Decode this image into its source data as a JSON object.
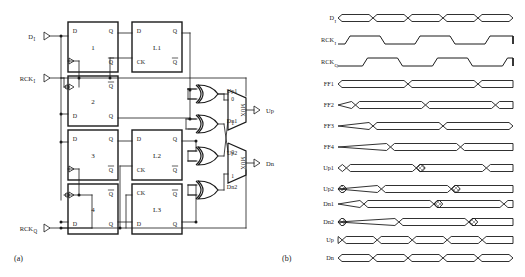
{
  "figure": {
    "panels": [
      {
        "id": "a",
        "caption": "(a)",
        "type": "schematic"
      },
      {
        "id": "b",
        "caption": "(b)",
        "type": "timing-diagram"
      }
    ]
  },
  "schematic": {
    "inputs": [
      {
        "name": "D_I",
        "label": "D",
        "sub": "I",
        "y": 36
      },
      {
        "name": "RCK_I",
        "label": "RCK",
        "sub": "I",
        "y": 78
      },
      {
        "name": "RCK_Q",
        "label": "RCK",
        "sub": "Q",
        "y": 228
      }
    ],
    "outputs": [
      {
        "name": "Up",
        "label": "Up",
        "y": 110
      },
      {
        "name": "Dn",
        "label": "Dn",
        "y": 163
      }
    ],
    "flipflops": [
      {
        "id": "ff1",
        "label": "1",
        "x": 68,
        "y": 22,
        "w": 50,
        "h": 50,
        "pins": {
          "d": "D",
          "q": "Q",
          "qb": "Q"
        },
        "inverted_clk": false,
        "clk_top": false
      },
      {
        "id": "ff2",
        "label": "2",
        "x": 68,
        "y": 76,
        "w": 50,
        "h": 50,
        "pins": {
          "d": "D",
          "q": "Q",
          "qb": "Q"
        },
        "inverted_clk": true,
        "clk_top": true
      },
      {
        "id": "ff3",
        "label": "3",
        "x": 68,
        "y": 130,
        "w": 50,
        "h": 50,
        "pins": {
          "d": "D",
          "q": "Q",
          "qb": "Q"
        },
        "inverted_clk": false,
        "clk_top": false
      },
      {
        "id": "ff4",
        "label": "4",
        "x": 68,
        "y": 184,
        "w": 50,
        "h": 50,
        "pins": {
          "d": "D",
          "q": "Q",
          "qb": "Q"
        },
        "inverted_clk": true,
        "clk_top": true
      }
    ],
    "latches": [
      {
        "id": "l1",
        "label": "L1",
        "x": 132,
        "y": 22,
        "w": 50,
        "h": 50,
        "pins": {
          "d": "D",
          "ck": "CK",
          "q": "Q",
          "qb": "Q"
        },
        "ck_top": false
      },
      {
        "id": "l2",
        "label": "L2",
        "x": 132,
        "y": 130,
        "w": 50,
        "h": 50,
        "pins": {
          "d": "D",
          "ck": "CK",
          "q": "Q",
          "qb": "Q"
        },
        "ck_top": false
      },
      {
        "id": "l3",
        "label": "L3",
        "x": 132,
        "y": 184,
        "w": 50,
        "h": 50,
        "pins": {
          "d": "D",
          "ck": "CK",
          "q": "Q",
          "qb": "Q"
        },
        "ck_top": true
      }
    ],
    "xor_gates": [
      {
        "id": "xor1",
        "out_label": "Up1",
        "y": 94
      },
      {
        "id": "xor2",
        "out_label": "Dn1",
        "y": 124
      },
      {
        "id": "xor3",
        "out_label": "Up2",
        "y": 156
      },
      {
        "id": "xor4",
        "out_label": "Dn2",
        "y": 190
      }
    ],
    "muxes": [
      {
        "id": "mux_up",
        "label": "MUX",
        "sel_labels": [
          "0",
          "1"
        ],
        "out": "Up",
        "y": 110
      },
      {
        "id": "mux_dn",
        "label": "MUX",
        "sel_labels": [
          "0",
          "1"
        ],
        "out": "Dn",
        "y": 163
      }
    ]
  },
  "timing": {
    "x_start": 338,
    "x_end": 513,
    "period": 35,
    "signals": [
      {
        "name": "D_I",
        "label": "D",
        "sub": "I",
        "y": 18,
        "type": "data",
        "phase": 0.0,
        "period": 35,
        "hatch": []
      },
      {
        "name": "RCK_I",
        "label": "RCK",
        "sub": "I",
        "y": 40,
        "type": "clock",
        "phase": 0.1,
        "period": 70,
        "hatch": []
      },
      {
        "name": "RCK_Q",
        "label": "RCK",
        "sub": "Q",
        "y": 62,
        "type": "clock",
        "phase": 0.35,
        "period": 70,
        "hatch": []
      },
      {
        "name": "FF1",
        "label": "FF1",
        "sub": "",
        "y": 84,
        "type": "data",
        "phase": 0.0,
        "period": 70,
        "hatch": []
      },
      {
        "name": "FF2",
        "label": "FF2",
        "sub": "",
        "y": 105,
        "type": "data",
        "phase": 0.25,
        "period": 70,
        "hatch": []
      },
      {
        "name": "FF3",
        "label": "FF3",
        "sub": "",
        "y": 126,
        "type": "data",
        "phase": 0.5,
        "period": 70,
        "hatch": []
      },
      {
        "name": "FF4",
        "label": "FF4",
        "sub": "",
        "y": 147,
        "type": "data",
        "phase": 0.75,
        "period": 70,
        "hatch": []
      },
      {
        "name": "Up1",
        "label": "Up1",
        "sub": "",
        "y": 168,
        "type": "data",
        "phase": 0.12,
        "period": 70,
        "hatch": [
          0,
          2,
          4
        ]
      },
      {
        "name": "Up2",
        "label": "Up2",
        "sub": "",
        "y": 189,
        "type": "data",
        "phase": 0.62,
        "period": 70,
        "hatch": [
          0,
          2,
          4
        ]
      },
      {
        "name": "Dn1",
        "label": "Dn1",
        "sub": "",
        "y": 204,
        "type": "data",
        "phase": 0.37,
        "period": 70,
        "hatch": [
          0,
          2,
          4
        ]
      },
      {
        "name": "Dn2",
        "label": "Dn2",
        "sub": "",
        "y": 222,
        "type": "data",
        "phase": 0.87,
        "period": 70,
        "hatch": [
          0,
          2,
          4
        ]
      },
      {
        "name": "Up",
        "label": "Up",
        "sub": "",
        "y": 240,
        "type": "data",
        "phase": 0.12,
        "period": 35,
        "hatch": []
      },
      {
        "name": "Dn",
        "label": "Dn",
        "sub": "",
        "y": 258,
        "type": "data",
        "phase": 0.0,
        "period": 35,
        "hatch": []
      }
    ]
  },
  "style": {
    "line_color": "#1a1a1a",
    "hatch_color": "#777777",
    "background": "#ffffff"
  }
}
